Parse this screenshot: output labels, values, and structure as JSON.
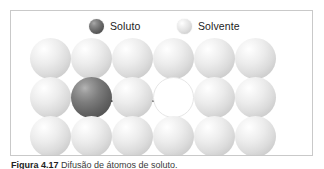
{
  "figure": {
    "type": "solid-state-diffusion-diagram",
    "caption_label": "Figura 4.17",
    "caption_text": "Difusão de átomos de soluto."
  },
  "legend": {
    "entries": [
      {
        "label": "Soluto",
        "swatch": "dark-sphere",
        "color": "#5a5a5a"
      },
      {
        "label": "Solvente",
        "swatch": "light-sphere",
        "color": "#dcdcdc"
      }
    ]
  },
  "lattice": {
    "columns": 6,
    "rows": 3,
    "cell_width": 41,
    "cell_height": 39,
    "origin_x": 19,
    "origin_y": 1,
    "sites": [
      [
        {
          "kind": "solvent"
        },
        {
          "kind": "solvent"
        },
        {
          "kind": "solvent"
        },
        {
          "kind": "solvent"
        },
        {
          "kind": "solvent"
        },
        {
          "kind": "solvent"
        }
      ],
      [
        {
          "kind": "solvent"
        },
        {
          "kind": "solute"
        },
        {
          "kind": "solvent"
        },
        {
          "kind": "vacancy"
        },
        {
          "kind": "solvent"
        },
        {
          "kind": "solvent"
        }
      ],
      [
        {
          "kind": "solvent"
        },
        {
          "kind": "solvent"
        },
        {
          "kind": "solvent"
        },
        {
          "kind": "solvent"
        },
        {
          "kind": "solvent"
        },
        {
          "kind": "solvent"
        }
      ]
    ]
  },
  "arrows": [
    {
      "name": "solute-motion-arrow",
      "x1": 87,
      "y1": 64,
      "x2": 125,
      "y2": 64
    },
    {
      "name": "solvent-motion-arrow",
      "x1": 128,
      "y1": 64,
      "x2": 168,
      "y2": 64
    }
  ],
  "colors": {
    "frame": "#c9c9c9",
    "background": "#ffffff",
    "solute": "#5a5a5a",
    "solvent": "#dcdcdc",
    "vacancy": "#ffffff",
    "arrow": "#000000",
    "text": "#1c1c1c"
  }
}
